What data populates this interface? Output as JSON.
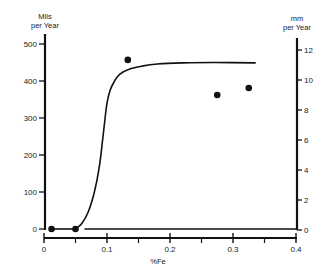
{
  "chart_data": {
    "type": "scatter",
    "title": "",
    "xlabel": "%Fe",
    "ylabel": "Mils per Year",
    "ylabel_left_lines": [
      "Mils",
      "per Year"
    ],
    "y2label": "mm per Year",
    "ylabel_right_lines": [
      "mm",
      "per Year"
    ],
    "xlim": [
      0,
      0.4
    ],
    "ylim": [
      0,
      500
    ],
    "y2lim": [
      0,
      12
    ],
    "x_ticks": [
      0,
      0.1,
      0.2,
      0.3,
      0.4
    ],
    "x_tick_labels": [
      "0",
      "0.1",
      "0.2",
      "0.3",
      "0.4"
    ],
    "x_minor_ticks": [
      0.05,
      0.15,
      0.25,
      0.35
    ],
    "y_ticks": [
      0,
      100,
      200,
      300,
      400,
      500
    ],
    "y_tick_labels": [
      "0",
      "100",
      "200",
      "300",
      "400",
      "500"
    ],
    "y2_ticks": [
      0,
      2,
      4,
      6,
      8,
      10,
      12
    ],
    "y2_tick_labels": [
      "0",
      "2",
      "4",
      "6",
      "8",
      "10",
      "12"
    ],
    "grid": false,
    "legend": null,
    "series": [
      {
        "name": "measured",
        "type": "scatter",
        "x": [
          0.012,
          0.05,
          0.133,
          0.275,
          0.325
        ],
        "y": [
          0,
          0,
          457,
          362,
          381
        ]
      },
      {
        "name": "trend curve",
        "type": "line",
        "x": [
          0.05,
          0.06,
          0.07,
          0.08,
          0.088,
          0.093,
          0.097,
          0.1,
          0.105,
          0.112,
          0.12,
          0.135,
          0.155,
          0.18,
          0.22,
          0.27,
          0.335
        ],
        "y": [
          0,
          15,
          45,
          100,
          170,
          240,
          300,
          340,
          375,
          400,
          418,
          432,
          440,
          446,
          449,
          450,
          449
        ]
      },
      {
        "name": "baseline",
        "type": "line",
        "x": [
          0.065,
          0.4
        ],
        "y": [
          0,
          0
        ]
      }
    ]
  }
}
